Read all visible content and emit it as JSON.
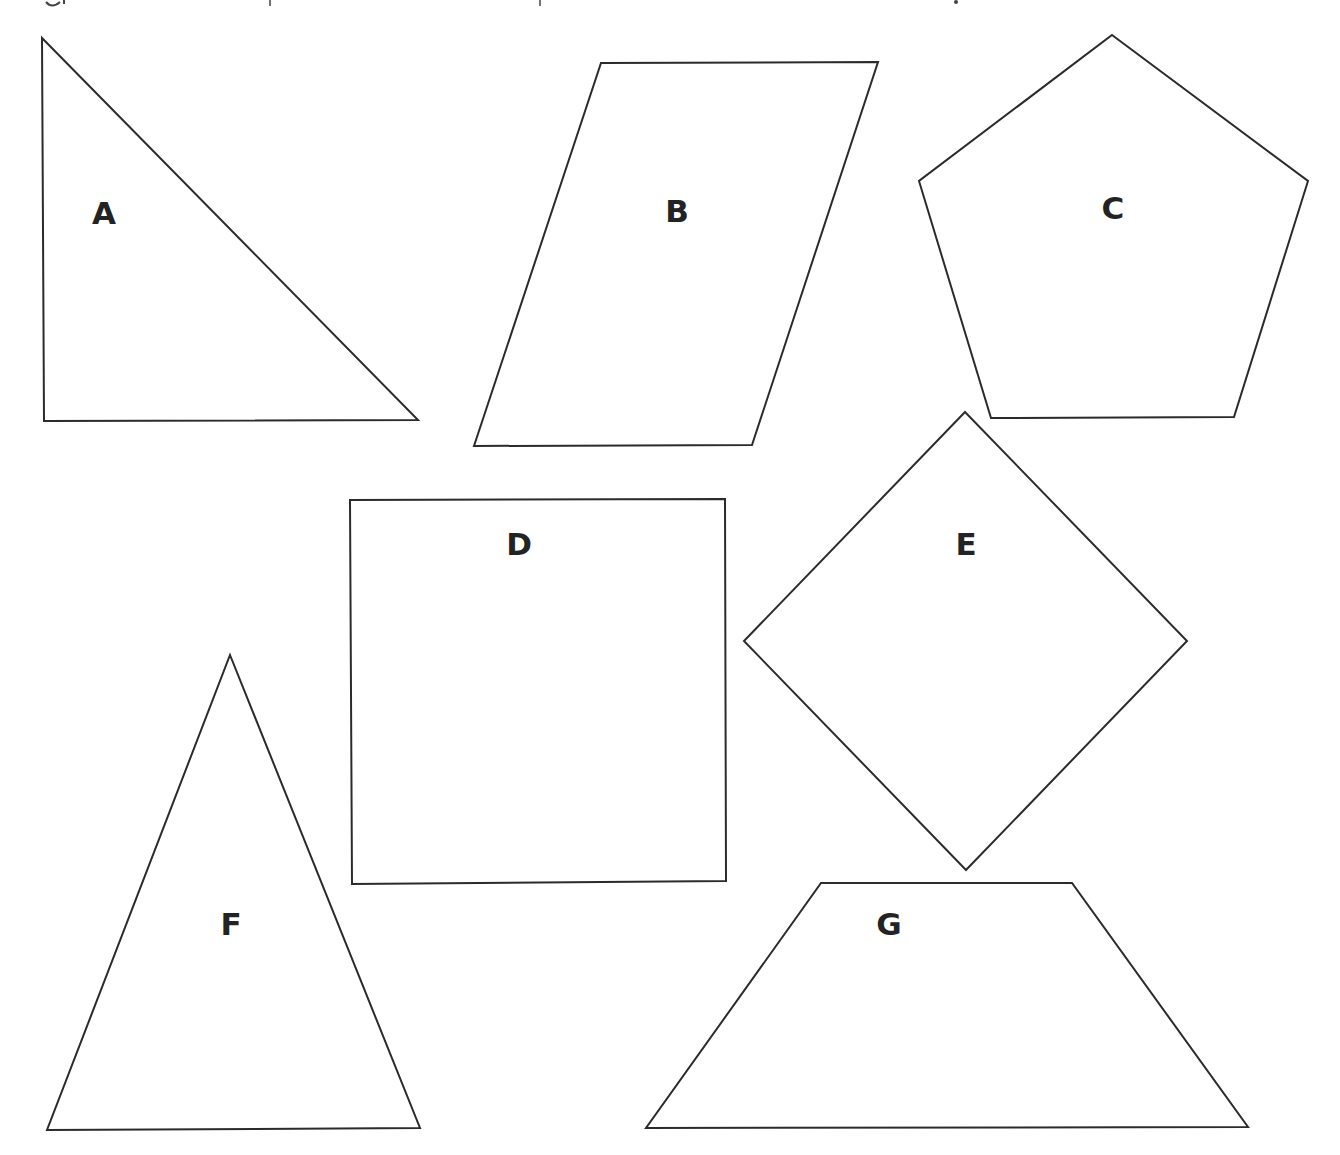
{
  "figure": {
    "background": "#ffffff",
    "stroke_color": "#2b2b2b",
    "label_color": "#232323",
    "shapes": [
      {
        "id": "A",
        "label": "A",
        "kind": "right-triangle",
        "points": "42,38 418,420 44,421",
        "label_pos": [
          104,
          213
        ]
      },
      {
        "id": "B",
        "label": "B",
        "kind": "parallelogram",
        "points": "601,63 878,62 752,445 474,446",
        "label_pos": [
          677,
          211
        ]
      },
      {
        "id": "C",
        "label": "C",
        "kind": "pentagon",
        "points": "1112,35 1308,181 1234,417 991,418 919,181",
        "label_pos": [
          1113,
          208
        ]
      },
      {
        "id": "D",
        "label": "D",
        "kind": "square",
        "points": "350,500 725,499 726,881 352,884",
        "label_pos": [
          519,
          544
        ]
      },
      {
        "id": "E",
        "label": "E",
        "kind": "rhombus",
        "points": "965,412 1187,641 966,870 744,641",
        "label_pos": [
          966,
          544
        ]
      },
      {
        "id": "F",
        "label": "F",
        "kind": "isosceles-triangle",
        "points": "230,655 420,1128 47,1130",
        "label_pos": [
          231,
          924
        ]
      },
      {
        "id": "G",
        "label": "G",
        "kind": "trapezoid",
        "points": "821,883 1072,883 1248,1127 646,1128",
        "label_pos": [
          889,
          924
        ]
      }
    ]
  }
}
